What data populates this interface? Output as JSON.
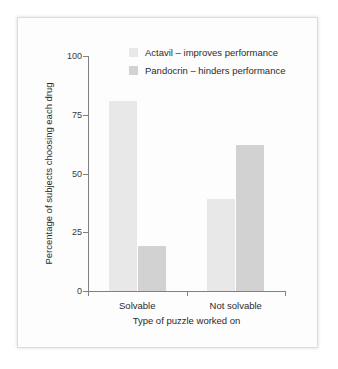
{
  "figure": {
    "background_color": "#fdfdfd",
    "frame_color": "#dcdcdc"
  },
  "chart_data": {
    "type": "bar",
    "title": "",
    "subtitle": "",
    "xlabel": "Type of puzzle worked on",
    "ylabel": "Percentage of subjects choosing each drug",
    "categories": [
      "Solvable",
      "Not solvable"
    ],
    "series": [
      {
        "name": "Actavil – improves performance",
        "values": [
          81,
          39
        ],
        "color": "#e8e8e8"
      },
      {
        "name": "Pandocrin – hinders performance",
        "values": [
          19,
          62
        ],
        "color": "#d2d2d2"
      }
    ],
    "ylim": [
      0,
      100
    ],
    "yticks": [
      0,
      25,
      50,
      75,
      100
    ],
    "ytick_labels": [
      "0",
      "25",
      "50",
      "75",
      "100"
    ],
    "grid": false,
    "legend_position": "top-right"
  },
  "axis": {
    "y_tick_labels": [
      "100",
      "75",
      "50",
      "25",
      "0"
    ],
    "x_tick_labels": [
      "Solvable",
      "Not solvable"
    ],
    "x_title": "Type of puzzle worked on",
    "y_title": "Percentage of subjects choosing each drug"
  },
  "legend": {
    "items": [
      {
        "label": "Actavil – improves performance",
        "color": "#e8e8e8"
      },
      {
        "label": "Pandocrin – hinders performance",
        "color": "#d2d2d2"
      }
    ]
  }
}
